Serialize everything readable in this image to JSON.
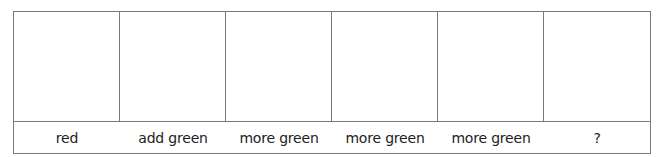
{
  "diagram": {
    "type": "color-mixing-strip",
    "border_color": "#7a7a7a",
    "text_color": "#222222",
    "columns": [
      {
        "swatch": "",
        "label": "red"
      },
      {
        "swatch": "",
        "label": "add green"
      },
      {
        "swatch": "",
        "label": "more green"
      },
      {
        "swatch": "",
        "label": "more green"
      },
      {
        "swatch": "",
        "label": "more green"
      },
      {
        "swatch": "",
        "label": "?"
      }
    ]
  }
}
